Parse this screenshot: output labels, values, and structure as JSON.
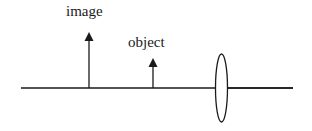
{
  "diagram": {
    "type": "optics ray diagram",
    "labels": {
      "image": "image",
      "object": "object"
    },
    "elements": {
      "optical_axis": {
        "x1": 21,
        "x2": 293,
        "y": 88
      },
      "image_arrow": {
        "x": 89,
        "base_y": 88,
        "tip_y": 33
      },
      "object_arrow": {
        "x": 153,
        "base_y": 88,
        "tip_y": 59
      },
      "lens": {
        "cx": 221,
        "cy": 88,
        "rx": 6,
        "ry": 34
      }
    },
    "colors": {
      "stroke": "#1a1a1a",
      "background": "#ffffff"
    }
  }
}
